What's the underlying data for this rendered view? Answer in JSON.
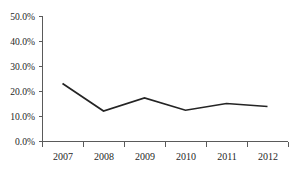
{
  "chart_data": {
    "type": "line",
    "title": "",
    "subtitle": "",
    "xlabel": "",
    "ylabel": "",
    "categories": [
      "2007",
      "2008",
      "2009",
      "2010",
      "2011",
      "2012"
    ],
    "values": [
      23.0,
      12.0,
      17.2,
      12.3,
      15.0,
      13.8
    ],
    "series": [
      {
        "name": "",
        "values": [
          23.0,
          12.0,
          17.2,
          12.3,
          15.0,
          13.8
        ]
      }
    ],
    "ylim": [
      0,
      50
    ],
    "ytick_values": [
      0,
      10,
      20,
      30,
      40,
      50
    ],
    "ytick_labels": [
      "0.0%",
      "10.0%",
      "20.0%",
      "30.0%",
      "40.0%",
      "50.0%"
    ],
    "xtick_labels": [
      "2007",
      "2008",
      "2009",
      "2010",
      "2011",
      "2012"
    ],
    "grid": false,
    "legend": false,
    "legend_position": "none",
    "annotations": [],
    "line_color": "#242424",
    "axis_color": "#5a5a5a",
    "background_color": "#ffffff"
  },
  "figure": {
    "clipped_title_fragment": "",
    "plot_area": {
      "left": 42,
      "right": 288,
      "top": 16,
      "bottom": 141
    }
  }
}
